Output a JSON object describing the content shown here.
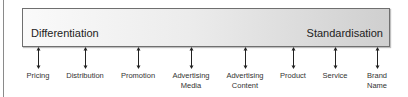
{
  "spectrum": {
    "left_label": "Differentiation",
    "right_label": "Standardisation"
  },
  "items": [
    {
      "label": "Pricing",
      "x": 38
    },
    {
      "label": "Distribution",
      "x": 85
    },
    {
      "label": "Promotion",
      "x": 138
    },
    {
      "label": "Advertising Media",
      "x": 191
    },
    {
      "label": "Advertising Content",
      "x": 245
    },
    {
      "label": "Product",
      "x": 293
    },
    {
      "label": "Service",
      "x": 335
    },
    {
      "label": "Brand Name",
      "x": 377
    }
  ],
  "colors": {
    "bar_left": "#fafafa",
    "bar_right": "#cfcfcf",
    "arrow": "#222222"
  }
}
